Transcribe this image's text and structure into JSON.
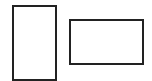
{
  "canvas": {
    "width": 152,
    "height": 81,
    "background": "#ffffff"
  },
  "shapes": [
    {
      "id": "portrait-rectangle",
      "type": "rectangle",
      "x": 12,
      "y": 5,
      "width": 45,
      "height": 76,
      "stroke": "#222222",
      "fill": "#ffffff"
    },
    {
      "id": "landscape-rectangle",
      "type": "rectangle",
      "x": 69,
      "y": 19,
      "width": 75,
      "height": 46,
      "stroke": "#222222",
      "fill": "#ffffff"
    }
  ]
}
